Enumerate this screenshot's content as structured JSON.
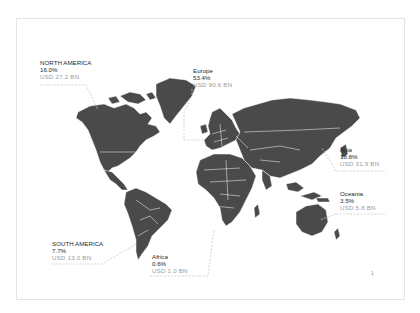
{
  "colors": {
    "land": "#4a4a4a",
    "border": "#ffffff",
    "label_primary": "#2a2a2a",
    "label_secondary": "#9a9a9a",
    "leader_line": "#c9c9c9",
    "card_border": "#e4e4e4"
  },
  "regions": [
    {
      "id": "north-america",
      "name": "NORTH AMERICA",
      "share": "16.0%",
      "value": "USD 27.2 BN"
    },
    {
      "id": "europe",
      "name": "Europe",
      "share": "53.4%",
      "value": "USD 90.6 BN"
    },
    {
      "id": "asia",
      "name": "Asia",
      "share": "18.8%",
      "value": "USD 31.9 BN"
    },
    {
      "id": "oceania",
      "name": "Oceania",
      "share": "3.5%",
      "value": "USD 5.8 BN"
    },
    {
      "id": "south-america",
      "name": "SOUTH AMERICA",
      "share": "7.7%",
      "value": "USD 13.0 BN"
    },
    {
      "id": "africa",
      "name": "Africa",
      "share": "0.6%",
      "value": "USD 1.0 BN"
    }
  ],
  "footer": {
    "marker": "1"
  }
}
